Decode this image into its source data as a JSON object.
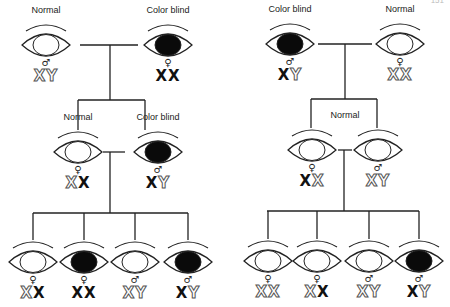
{
  "page_number": "151",
  "colors": {
    "line": "#222222",
    "affected_fill": "#0a0a0a",
    "normal_fill": "#ffffff"
  },
  "pedigrees": [
    {
      "name": "left",
      "parents": [
        {
          "label": "Normal",
          "sex": "♂",
          "status": "normal",
          "genotype": [
            {
              "c": "X",
              "t": "normal"
            },
            {
              "c": "Y",
              "t": "normal"
            }
          ]
        },
        {
          "label": "Color blind",
          "sex": "♀",
          "status": "affected",
          "genotype": [
            {
              "c": "X",
              "t": "affected"
            },
            {
              "c": "X",
              "t": "affected"
            }
          ]
        }
      ],
      "f1": [
        {
          "label": "Normal",
          "sex": "♀",
          "status": "normal",
          "genotype": [
            {
              "c": "X",
              "t": "normal"
            },
            {
              "c": "X",
              "t": "affected"
            }
          ]
        },
        {
          "label": "Color blind",
          "sex": "♂",
          "status": "affected",
          "genotype": [
            {
              "c": "X",
              "t": "affected"
            },
            {
              "c": "Y",
              "t": "normal"
            }
          ]
        }
      ],
      "f2": [
        {
          "sex": "♀",
          "status": "normal",
          "genotype": [
            {
              "c": "X",
              "t": "normal"
            },
            {
              "c": "X",
              "t": "affected"
            }
          ]
        },
        {
          "sex": "♀",
          "status": "affected",
          "genotype": [
            {
              "c": "X",
              "t": "affected"
            },
            {
              "c": "X",
              "t": "affected"
            }
          ]
        },
        {
          "sex": "♂",
          "status": "normal",
          "genotype": [
            {
              "c": "X",
              "t": "normal"
            },
            {
              "c": "Y",
              "t": "normal"
            }
          ]
        },
        {
          "sex": "♂",
          "status": "affected",
          "genotype": [
            {
              "c": "X",
              "t": "affected"
            },
            {
              "c": "Y",
              "t": "normal"
            }
          ]
        }
      ]
    },
    {
      "name": "right",
      "parents": [
        {
          "label": "Color blind",
          "sex": "♂",
          "status": "affected",
          "genotype": [
            {
              "c": "X",
              "t": "affected"
            },
            {
              "c": "Y",
              "t": "normal"
            }
          ]
        },
        {
          "label": "Normal",
          "sex": "♀",
          "status": "normal",
          "genotype": [
            {
              "c": "X",
              "t": "normal"
            },
            {
              "c": "X",
              "t": "normal"
            }
          ]
        }
      ],
      "f1_label": "Normal",
      "f1": [
        {
          "sex": "♀",
          "status": "normal",
          "genotype": [
            {
              "c": "X",
              "t": "affected"
            },
            {
              "c": "X",
              "t": "normal"
            }
          ]
        },
        {
          "sex": "♂",
          "status": "normal",
          "genotype": [
            {
              "c": "X",
              "t": "normal"
            },
            {
              "c": "Y",
              "t": "normal"
            }
          ]
        }
      ],
      "f2": [
        {
          "sex": "♀",
          "status": "normal",
          "genotype": [
            {
              "c": "X",
              "t": "normal"
            },
            {
              "c": "X",
              "t": "normal"
            }
          ]
        },
        {
          "sex": "♀",
          "status": "normal",
          "genotype": [
            {
              "c": "X",
              "t": "normal"
            },
            {
              "c": "X",
              "t": "affected"
            }
          ]
        },
        {
          "sex": "♂",
          "status": "normal",
          "genotype": [
            {
              "c": "X",
              "t": "normal"
            },
            {
              "c": "Y",
              "t": "normal"
            }
          ]
        },
        {
          "sex": "♂",
          "status": "affected",
          "genotype": [
            {
              "c": "X",
              "t": "affected"
            },
            {
              "c": "Y",
              "t": "normal"
            }
          ]
        }
      ]
    }
  ]
}
